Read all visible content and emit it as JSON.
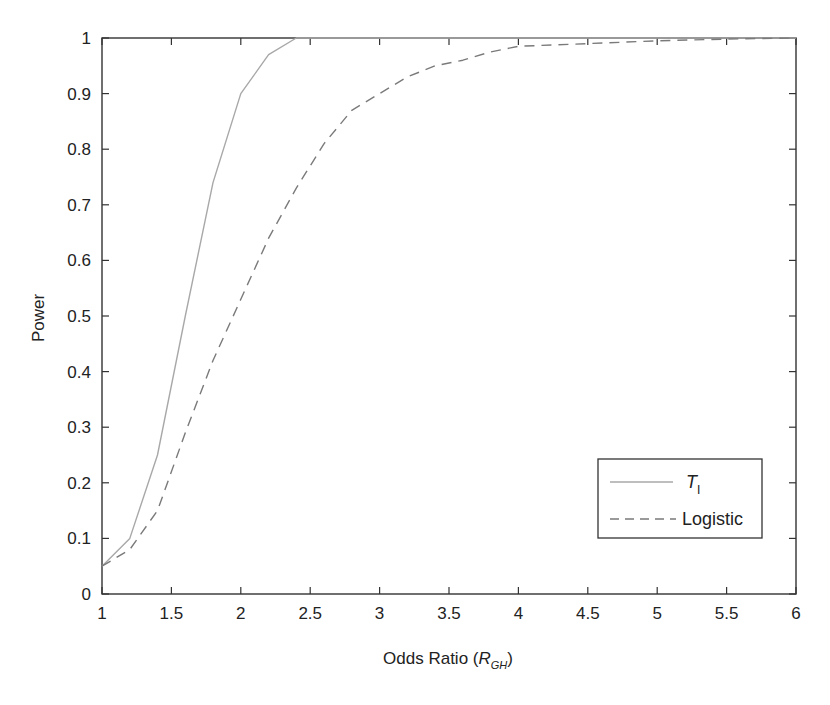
{
  "chart_data": {
    "type": "line",
    "title": "",
    "xlabel": "Odds Ratio (R_GH)",
    "xlabel_main": "Odds Ratio (",
    "xlabel_symbol": "R",
    "xlabel_subscript": "GH",
    "xlabel_close": ")",
    "ylabel": "Power",
    "xlim": [
      1,
      6
    ],
    "ylim": [
      0,
      1
    ],
    "grid": false,
    "legend_position": "lower right",
    "x_ticks": [
      "1",
      "1.5",
      "2",
      "2.5",
      "3",
      "3.5",
      "4",
      "4.5",
      "5",
      "5.5",
      "6"
    ],
    "y_ticks": [
      "0",
      "0.1",
      "0.2",
      "0.3",
      "0.4",
      "0.5",
      "0.6",
      "0.7",
      "0.8",
      "0.9",
      "1"
    ],
    "series": [
      {
        "name": "T_I",
        "legend_symbol": "T",
        "legend_subscript": "I",
        "style": "solid",
        "color": "#a8a8a8",
        "x": [
          1,
          1.2,
          1.4,
          1.6,
          1.8,
          2.0,
          2.2,
          2.4,
          2.6,
          3,
          4,
          5,
          6
        ],
        "y": [
          0.05,
          0.1,
          0.25,
          0.5,
          0.74,
          0.9,
          0.97,
          1.0,
          1.0,
          1.0,
          1.0,
          1.0,
          1.0
        ]
      },
      {
        "name": "Logistic",
        "legend_label": "Logistic",
        "style": "dashed",
        "color": "#7a7a7a",
        "x": [
          1,
          1.2,
          1.4,
          1.6,
          1.8,
          2.0,
          2.2,
          2.4,
          2.6,
          2.8,
          3.0,
          3.2,
          3.4,
          3.6,
          3.8,
          4.0,
          4.5,
          5.0,
          5.5,
          6.0
        ],
        "y": [
          0.05,
          0.08,
          0.15,
          0.29,
          0.42,
          0.53,
          0.64,
          0.73,
          0.81,
          0.87,
          0.9,
          0.93,
          0.95,
          0.96,
          0.975,
          0.985,
          0.99,
          0.995,
          0.998,
          1.0
        ]
      }
    ]
  },
  "colors": {
    "axis": "#333333",
    "t1_line": "#a8a8a8",
    "logistic_line": "#7a7a7a"
  }
}
